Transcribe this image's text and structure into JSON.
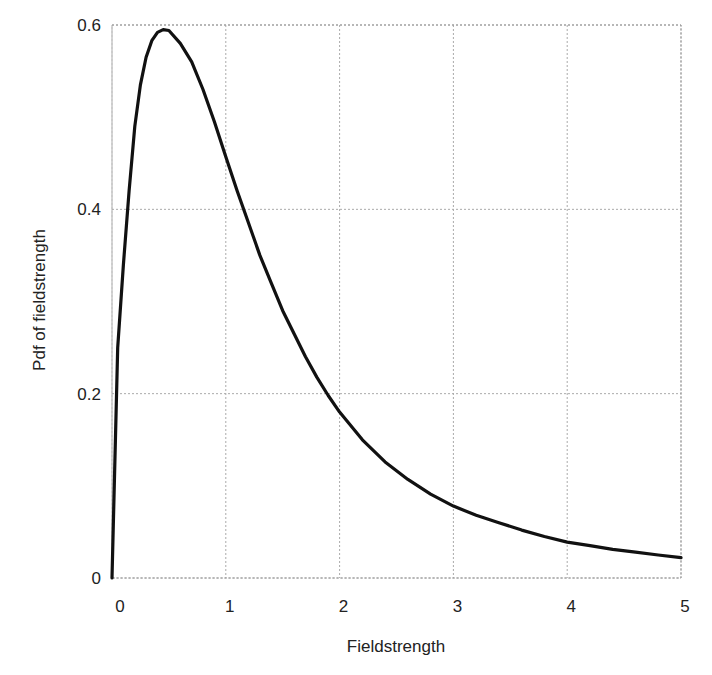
{
  "chart_data": {
    "type": "line",
    "title": "",
    "xlabel": "Fieldstrength",
    "ylabel": "Pdf of fieldstrength",
    "xlim": [
      0,
      5
    ],
    "ylim": [
      0,
      0.6
    ],
    "x_ticks": [
      "0",
      "1",
      "2",
      "3",
      "4",
      "5"
    ],
    "y_ticks": [
      "0",
      "0.2",
      "0.4",
      "0.6"
    ],
    "grid": true,
    "legend": null,
    "series": [
      {
        "name": "pdf",
        "color": "#111111",
        "x": [
          0,
          0.05,
          0.1,
          0.15,
          0.2,
          0.25,
          0.3,
          0.35,
          0.4,
          0.45,
          0.5,
          0.6,
          0.7,
          0.8,
          0.9,
          1.0,
          1.1,
          1.2,
          1.3,
          1.4,
          1.5,
          1.6,
          1.7,
          1.8,
          1.9,
          2.0,
          2.2,
          2.4,
          2.6,
          2.8,
          3.0,
          3.2,
          3.4,
          3.6,
          3.8,
          4.0,
          4.2,
          4.4,
          4.6,
          4.8,
          5.0
        ],
        "y": [
          0,
          0.25,
          0.34,
          0.42,
          0.49,
          0.535,
          0.565,
          0.583,
          0.592,
          0.595,
          0.594,
          0.58,
          0.56,
          0.53,
          0.495,
          0.457,
          0.42,
          0.385,
          0.35,
          0.32,
          0.29,
          0.265,
          0.24,
          0.218,
          0.198,
          0.18,
          0.15,
          0.126,
          0.107,
          0.091,
          0.078,
          0.068,
          0.06,
          0.052,
          0.045,
          0.039,
          0.035,
          0.031,
          0.028,
          0.025,
          0.022
        ]
      }
    ]
  }
}
